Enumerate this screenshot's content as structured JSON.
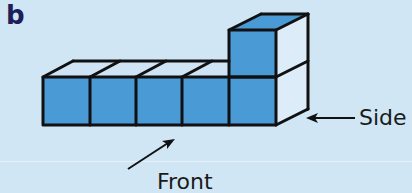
{
  "figure": {
    "panel_label": "b",
    "labels": {
      "side": "Side",
      "front": "Front"
    },
    "colors": {
      "background": "#d0e6f4",
      "front_face": "#4a9ad6",
      "top_face_light": "#cfe5f5",
      "top_face_blue": "#4a9ad6",
      "side_face": "#dcecf8",
      "edge": "#111111",
      "panel_label": "#1c1f5a"
    },
    "structure": {
      "bottom_row_cubes": 5,
      "stacked_cubes": 1,
      "stack_position": "rightmost"
    }
  }
}
